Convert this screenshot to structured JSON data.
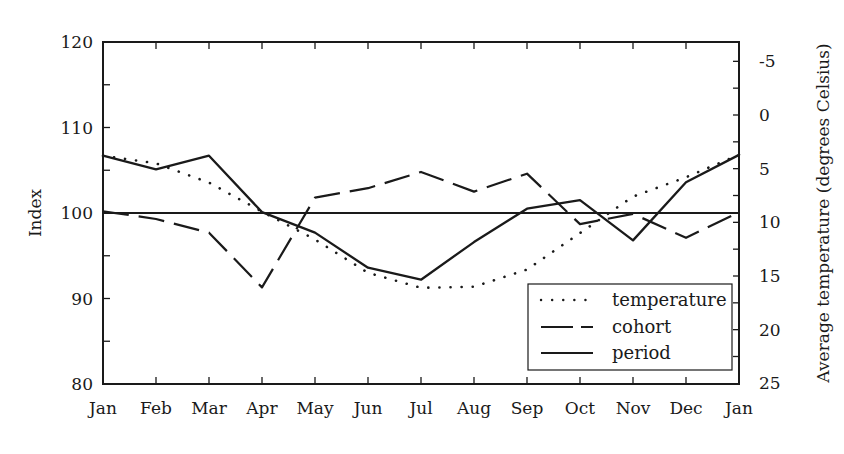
{
  "chart_data": {
    "type": "line",
    "title": "",
    "xlabel": "",
    "ylabel": "Index",
    "ylabel_right": "Average temperature (degrees Celsius)",
    "categories": [
      "Jan",
      "Feb",
      "Mar",
      "Apr",
      "May",
      "Jun",
      "Jul",
      "Aug",
      "Sep",
      "Oct",
      "Nov",
      "Dec",
      "Jan"
    ],
    "ylim": [
      80,
      120
    ],
    "yticks": [
      80,
      90,
      100,
      110,
      120
    ],
    "ylim_right": [
      25,
      -7
    ],
    "yticks_right": [
      -5,
      0,
      5,
      10,
      15,
      20,
      25
    ],
    "right_axis_inverted": true,
    "reference_line": 100,
    "grid": false,
    "legend_position": "lower right",
    "series": [
      {
        "name": "temperature",
        "axis": "right",
        "style": "dotted",
        "values": [
          3.8,
          4.5,
          6.3,
          9.0,
          11.6,
          14.7,
          16.1,
          16.0,
          14.4,
          11.0,
          7.6,
          5.8,
          3.7
        ]
      },
      {
        "name": "cohort",
        "axis": "left",
        "style": "dashed",
        "values": [
          100.2,
          99.3,
          97.7,
          91.3,
          101.8,
          102.9,
          104.8,
          102.5,
          104.6,
          98.7,
          99.9,
          97.1,
          100.1
        ]
      },
      {
        "name": "period",
        "axis": "left",
        "style": "solid",
        "values": [
          106.7,
          105.1,
          106.7,
          100.1,
          97.7,
          93.6,
          92.2,
          96.6,
          100.5,
          101.5,
          96.8,
          103.6,
          106.8
        ]
      }
    ]
  },
  "legend": {
    "items": [
      {
        "label": "temperature",
        "style": "dotted"
      },
      {
        "label": "cohort",
        "style": "dashed"
      },
      {
        "label": "period",
        "style": "solid"
      }
    ]
  },
  "colors": {
    "line": "#1a1a1a",
    "background": "#ffffff"
  }
}
